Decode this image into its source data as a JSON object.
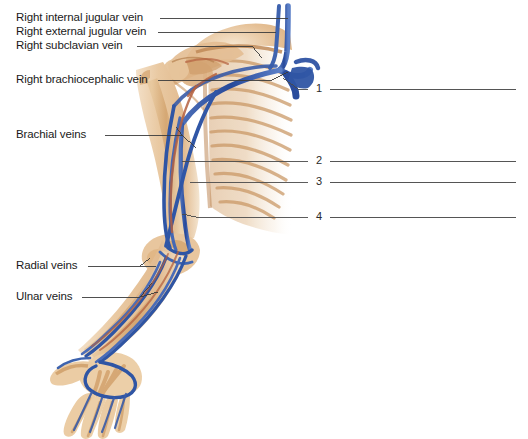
{
  "figure": {
    "background_color": "#ffffff",
    "width": 528,
    "height": 439
  },
  "palette": {
    "vein_blue": "#2f55a4",
    "vein_blue_dark": "#1f3d82",
    "vein_blue_light": "#5a7fc4",
    "artery_red": "#b05a3c",
    "skin_tan": "#e8c49a",
    "skin_light": "#f2dcc2",
    "bone_tan": "#d8ab76",
    "bone_light": "#ecd3ae",
    "leader_line": "#3c3c3c",
    "answer_line": "#555555",
    "text": "#1a1a1a"
  },
  "labels": [
    {
      "id": "internal-jugular",
      "text": "Right internal jugular vein",
      "x": 16,
      "y": 14,
      "leader_to_x": 288,
      "leader_to_y": 17
    },
    {
      "id": "external-jugular",
      "text": "Right external jugular vein",
      "x": 16,
      "y": 28,
      "leader_to_x": 276,
      "leader_to_y": 31
    },
    {
      "id": "subclavian",
      "text": "Right subclavian vein",
      "x": 16,
      "y": 42,
      "leader_to_x": 258,
      "leader_to_y": 55
    },
    {
      "id": "brachiocephalic",
      "text": "Right brachiocephalic vein",
      "x": 16,
      "y": 76,
      "leader_to_x": 284,
      "leader_to_y": 74
    },
    {
      "id": "brachial",
      "text": "Brachial veins",
      "x": 16,
      "y": 131,
      "leader_to_x": 196,
      "leader_to_y": 131
    },
    {
      "id": "radial",
      "text": "Radial veins",
      "x": 16,
      "y": 262,
      "leader_to_x": 148,
      "leader_to_y": 258
    },
    {
      "id": "ulnar",
      "text": "Ulnar veins",
      "x": 16,
      "y": 293,
      "leader_to_x": 152,
      "leader_to_y": 281
    }
  ],
  "numbered_blanks": [
    {
      "number": "1",
      "x": 319,
      "y": 89,
      "leader_from_x": 283,
      "leader_from_y": 78,
      "line_start_x": 330,
      "line_end_x": 516
    },
    {
      "number": "2",
      "x": 319,
      "y": 161,
      "leader_from_x": 182,
      "leader_from_y": 161,
      "line_start_x": 330,
      "line_end_x": 516
    },
    {
      "number": "3",
      "x": 319,
      "y": 182,
      "leader_from_x": 190,
      "leader_from_y": 182,
      "line_start_x": 330,
      "line_end_x": 516
    },
    {
      "number": "4",
      "x": 319,
      "y": 217,
      "leader_from_x": 182,
      "leader_from_y": 214,
      "line_start_x": 330,
      "line_end_x": 516
    }
  ],
  "anatomy_parts": [
    {
      "name": "hand",
      "description": "right hand with metacarpals and phalanges, palmar venous network"
    },
    {
      "name": "forearm",
      "description": "radius and ulna with radial and ulnar veins"
    },
    {
      "name": "elbow",
      "description": "cubital fossa with median cubital vein"
    },
    {
      "name": "upper-arm",
      "description": "humerus with brachial veins and basilic vein"
    },
    {
      "name": "shoulder",
      "description": "scapula, clavicle, axillary vein"
    },
    {
      "name": "thorax",
      "description": "rib cage fading to the right"
    },
    {
      "name": "neck-veins",
      "description": "internal and external jugular veins"
    }
  ]
}
